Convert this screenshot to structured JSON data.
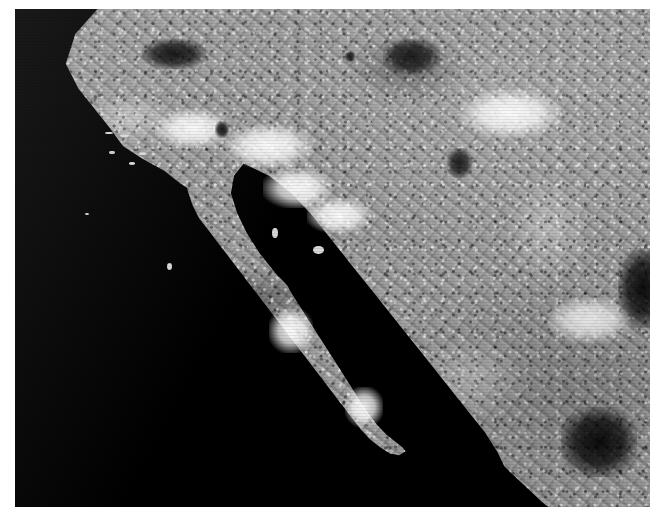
{
  "page": {
    "background_color": "#ffffff",
    "width": 664,
    "height": 523,
    "title": ""
  },
  "image": {
    "name": "satellite-grayscale-image",
    "kind": "satellite-imagery",
    "color_mode": "grayscale",
    "frame": {
      "left": 15,
      "top": 9,
      "width": 635,
      "height": 498
    },
    "background_color": "#000000",
    "water_color": "#000000",
    "land_mid_tone": "#9a9a9a",
    "highlight_color": "#ffffff",
    "shadow_color": "#000000",
    "caption": "",
    "alt_text": "Grayscale satellite view of the Baja California peninsula, the Gulf of California, the southwestern United States and northwestern Mexico. Ocean appears solid black; land shows bright desert and mountain texture."
  },
  "regions": [
    {
      "name": "pacific-ocean",
      "tone": "black",
      "label": ""
    },
    {
      "name": "gulf-of-california",
      "tone": "black",
      "label": ""
    },
    {
      "name": "baja-california-peninsula",
      "tone": "bright",
      "label": ""
    },
    {
      "name": "southern-california-coast",
      "tone": "bright",
      "label": ""
    },
    {
      "name": "sonoran-desert",
      "tone": "very-bright",
      "label": ""
    },
    {
      "name": "sierra-madre-occidental",
      "tone": "mottled-dark",
      "label": ""
    },
    {
      "name": "colorado-river-delta",
      "tone": "very-bright",
      "label": ""
    },
    {
      "name": "salton-sea",
      "tone": "black",
      "label": ""
    },
    {
      "name": "channel-islands",
      "tone": "bright-specks",
      "label": ""
    }
  ],
  "features": {
    "bright_patches": [
      {
        "name": "colorado-delta-bright",
        "x": 39,
        "y": 32,
        "w": 11,
        "h": 8
      },
      {
        "name": "altar-desert-bright",
        "x": 33,
        "y": 23,
        "w": 14,
        "h": 9
      },
      {
        "name": "sonora-coast-bright",
        "x": 46,
        "y": 38,
        "w": 10,
        "h": 7
      },
      {
        "name": "baja-mid-bright",
        "x": 40,
        "y": 60,
        "w": 7,
        "h": 9
      },
      {
        "name": "baja-south-bright",
        "x": 52,
        "y": 76,
        "w": 6,
        "h": 8
      },
      {
        "name": "sierra-highlight-north",
        "x": 70,
        "y": 16,
        "w": 16,
        "h": 10
      },
      {
        "name": "sierra-highlight-mid",
        "x": 84,
        "y": 58,
        "w": 13,
        "h": 9
      },
      {
        "name": "socal-valley-bright",
        "x": 22,
        "y": 20,
        "w": 12,
        "h": 8
      }
    ],
    "dark_patches": [
      {
        "name": "salton-sea",
        "x": 31.5,
        "y": 22.5,
        "w": 2.2,
        "h": 3.4
      },
      {
        "name": "lake-mead",
        "x": 52,
        "y": 8.5,
        "w": 1.6,
        "h": 2.2
      },
      {
        "name": "sierra-nevada-shadow",
        "x": 20,
        "y": 6,
        "w": 10,
        "h": 6
      },
      {
        "name": "mogollon-shadow",
        "x": 58,
        "y": 6,
        "w": 9,
        "h": 7
      },
      {
        "name": "reservoir-cluster",
        "x": 68,
        "y": 28,
        "w": 4,
        "h": 6
      },
      {
        "name": "sierra-madre-shadow-south",
        "x": 86,
        "y": 80,
        "w": 12,
        "h": 14
      },
      {
        "name": "sierra-madre-shadow-east",
        "x": 95,
        "y": 48,
        "w": 8,
        "h": 16
      }
    ],
    "islets": [
      {
        "name": "santa-cruz-island",
        "x": 16.5,
        "y": 25.0,
        "w": 1.5,
        "h": 0.7
      },
      {
        "name": "santa-rosa-island",
        "x": 14.2,
        "y": 24.6,
        "w": 1.2,
        "h": 0.6
      },
      {
        "name": "san-nicolas-island",
        "x": 14.8,
        "y": 28.6,
        "w": 0.9,
        "h": 0.5
      },
      {
        "name": "santa-catalina-island",
        "x": 19.6,
        "y": 28.8,
        "w": 1.0,
        "h": 0.5
      },
      {
        "name": "san-clemente-island",
        "x": 18.0,
        "y": 30.8,
        "w": 0.9,
        "h": 0.5
      },
      {
        "name": "guadalupe-island",
        "x": 11.0,
        "y": 41.0,
        "w": 0.7,
        "h": 0.4
      },
      {
        "name": "cedros-island",
        "x": 24.0,
        "y": 51.0,
        "w": 0.8,
        "h": 1.4
      },
      {
        "name": "angel-de-la-guarda",
        "x": 40.5,
        "y": 44.0,
        "w": 0.9,
        "h": 2.0
      },
      {
        "name": "tiburon-island",
        "x": 47.0,
        "y": 47.5,
        "w": 1.6,
        "h": 1.6
      }
    ]
  }
}
